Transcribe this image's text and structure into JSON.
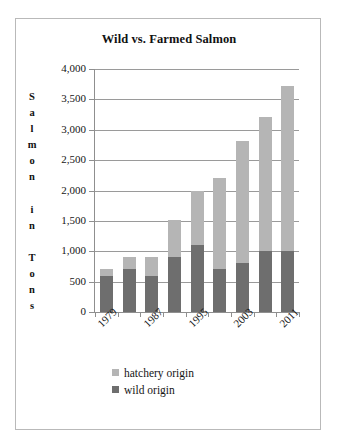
{
  "chart_data": {
    "type": "bar",
    "subtype": "stacked-bar",
    "title": "Wild vs. Farmed Salmon",
    "xlabel": "",
    "ylabel": "Salmon in Tons",
    "ylabel_stacked_letters": [
      "S",
      "a",
      "l",
      "m",
      "o",
      "n",
      "",
      "i",
      "n",
      "",
      "T",
      "o",
      "n",
      "s"
    ],
    "ylim": [
      0,
      4000
    ],
    "ytick_values": [
      0,
      500,
      1000,
      1500,
      2000,
      2500,
      3000,
      3500,
      4000
    ],
    "ytick_labels": [
      "0",
      "500",
      "1,000",
      "1,500",
      "2,000",
      "2,500",
      "3,000",
      "3,500",
      "4,000"
    ],
    "grid": true,
    "grid_axis": "y",
    "legend_position": "bottom",
    "categories": [
      "1979",
      "1983",
      "1987",
      "1991",
      "1995",
      "1999",
      "2003",
      "2007",
      "2011"
    ],
    "visible_xtick_labels": [
      "1979",
      "1987",
      "1995",
      "2003",
      "2011"
    ],
    "xtick_label_rotation": -45,
    "series": [
      {
        "name": "wild origin",
        "color": "#6e6e6e",
        "values": [
          600,
          700,
          600,
          900,
          1100,
          700,
          800,
          1010,
          1010
        ]
      },
      {
        "name": "hatchery origin",
        "color": "#b5b5b5",
        "values": [
          100,
          200,
          310,
          610,
          900,
          1510,
          2010,
          2200,
          2710
        ]
      }
    ],
    "totals": [
      700,
      900,
      910,
      1510,
      2000,
      2210,
      2810,
      3210,
      3720
    ],
    "legend": [
      {
        "label": "hatchery origin",
        "color": "#b5b5b5"
      },
      {
        "label": "wild origin",
        "color": "#6e6e6e"
      }
    ]
  }
}
